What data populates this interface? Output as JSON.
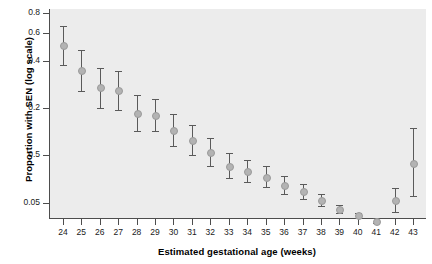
{
  "chart_data": {
    "type": "scatter",
    "title": "",
    "xlabel": "Estimated gestational age (weeks)",
    "ylabel": "Proportion with SEN (log scale)",
    "yscale": "log",
    "xlim": [
      23.3,
      43.7
    ],
    "ylim": [
      0.04,
      0.85
    ],
    "grid": false,
    "legend": null,
    "ytick_labels": [
      "0.8",
      "0.6",
      "0.4",
      "0.2",
      "0.5",
      "0.05"
    ],
    "ytick_values": [
      0.8,
      0.6,
      0.4,
      0.2,
      0.1,
      0.05
    ],
    "xtick_labels": [
      "24",
      "25",
      "26",
      "27",
      "28",
      "29",
      "30",
      "31",
      "32",
      "33",
      "34",
      "35",
      "36",
      "37",
      "38",
      "39",
      "40",
      "41",
      "42",
      "43"
    ],
    "categories": [
      24,
      25,
      26,
      27,
      28,
      29,
      30,
      31,
      32,
      33,
      34,
      35,
      36,
      37,
      38,
      39,
      40,
      41,
      42,
      43
    ],
    "values": [
      0.5,
      0.35,
      0.27,
      0.26,
      0.185,
      0.18,
      0.145,
      0.125,
      0.105,
      0.086,
      0.08,
      0.073,
      0.065,
      0.059,
      0.052,
      0.0455,
      0.0415,
      0.0385,
      0.052,
      0.09
    ],
    "error_low": [
      0.375,
      0.255,
      0.2,
      0.195,
      0.143,
      0.142,
      0.114,
      0.1,
      0.086,
      0.072,
      0.068,
      0.063,
      0.057,
      0.053,
      0.048,
      0.043,
      0.04,
      0.0372,
      0.0435,
      0.055
    ],
    "error_high": [
      0.66,
      0.47,
      0.36,
      0.345,
      0.24,
      0.228,
      0.184,
      0.156,
      0.129,
      0.103,
      0.094,
      0.085,
      0.074,
      0.066,
      0.057,
      0.0482,
      0.0431,
      0.0399,
      0.0622,
      0.15
    ],
    "series": [
      {
        "name": "Proportion with SEN",
        "marker": "circle",
        "marker_color": "#b3b3b3",
        "errorbar_color": "#5a5a5a"
      }
    ],
    "colors": {
      "panel_background": "#ececec",
      "axis": "#4d4d4d",
      "text": "#1a1a1a",
      "marker": "#b3b3b3",
      "errorbar": "#5a5a5a"
    }
  }
}
